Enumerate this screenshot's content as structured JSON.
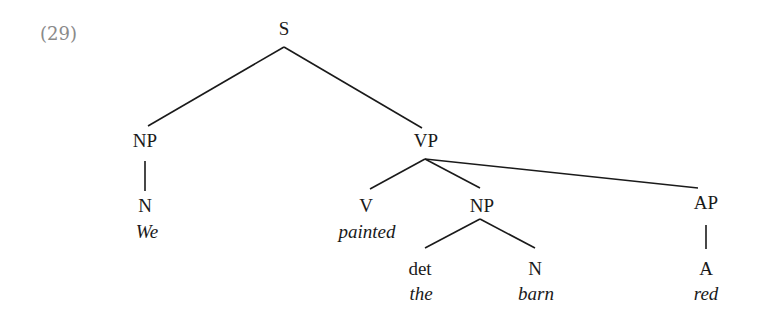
{
  "example_number": "(29)",
  "tree": {
    "root": "S",
    "nodes": {
      "s": {
        "label": "S"
      },
      "np_subj": {
        "label": "NP"
      },
      "n_subj": {
        "label": "N",
        "word": "We"
      },
      "vp": {
        "label": "VP"
      },
      "v": {
        "label": "V",
        "word": "painted"
      },
      "np_obj": {
        "label": "NP"
      },
      "det": {
        "label": "det",
        "word": "the"
      },
      "n_obj": {
        "label": "N",
        "word": "barn"
      },
      "ap": {
        "label": "AP"
      },
      "a": {
        "label": "A",
        "word": "red"
      }
    },
    "edges": [
      [
        "s",
        "np_subj"
      ],
      [
        "s",
        "vp"
      ],
      [
        "np_subj",
        "n_subj"
      ],
      [
        "vp",
        "v"
      ],
      [
        "vp",
        "np_obj"
      ],
      [
        "vp",
        "ap"
      ],
      [
        "np_obj",
        "det"
      ],
      [
        "np_obj",
        "n_obj"
      ],
      [
        "ap",
        "a"
      ]
    ]
  },
  "colors": {
    "text": "#1a1a1a",
    "number": "#8a8a8a",
    "background": "#ffffff"
  }
}
